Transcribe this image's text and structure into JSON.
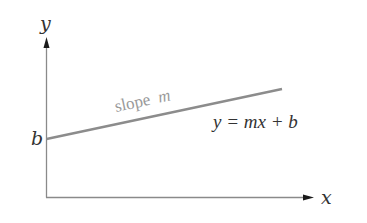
{
  "diagram": {
    "type": "linear-function-graph",
    "axes": {
      "x_label": "x",
      "y_label": "y"
    },
    "intercept_label": "b",
    "slope_label": "slope",
    "slope_symbol": "m",
    "equation": "y = mx + b",
    "colors": {
      "axis": "#8a8a8a",
      "arrow": "#1a1a1a",
      "line": "#8c8c8c",
      "text": "#333333",
      "slope_text": "#9a9a9a"
    }
  }
}
